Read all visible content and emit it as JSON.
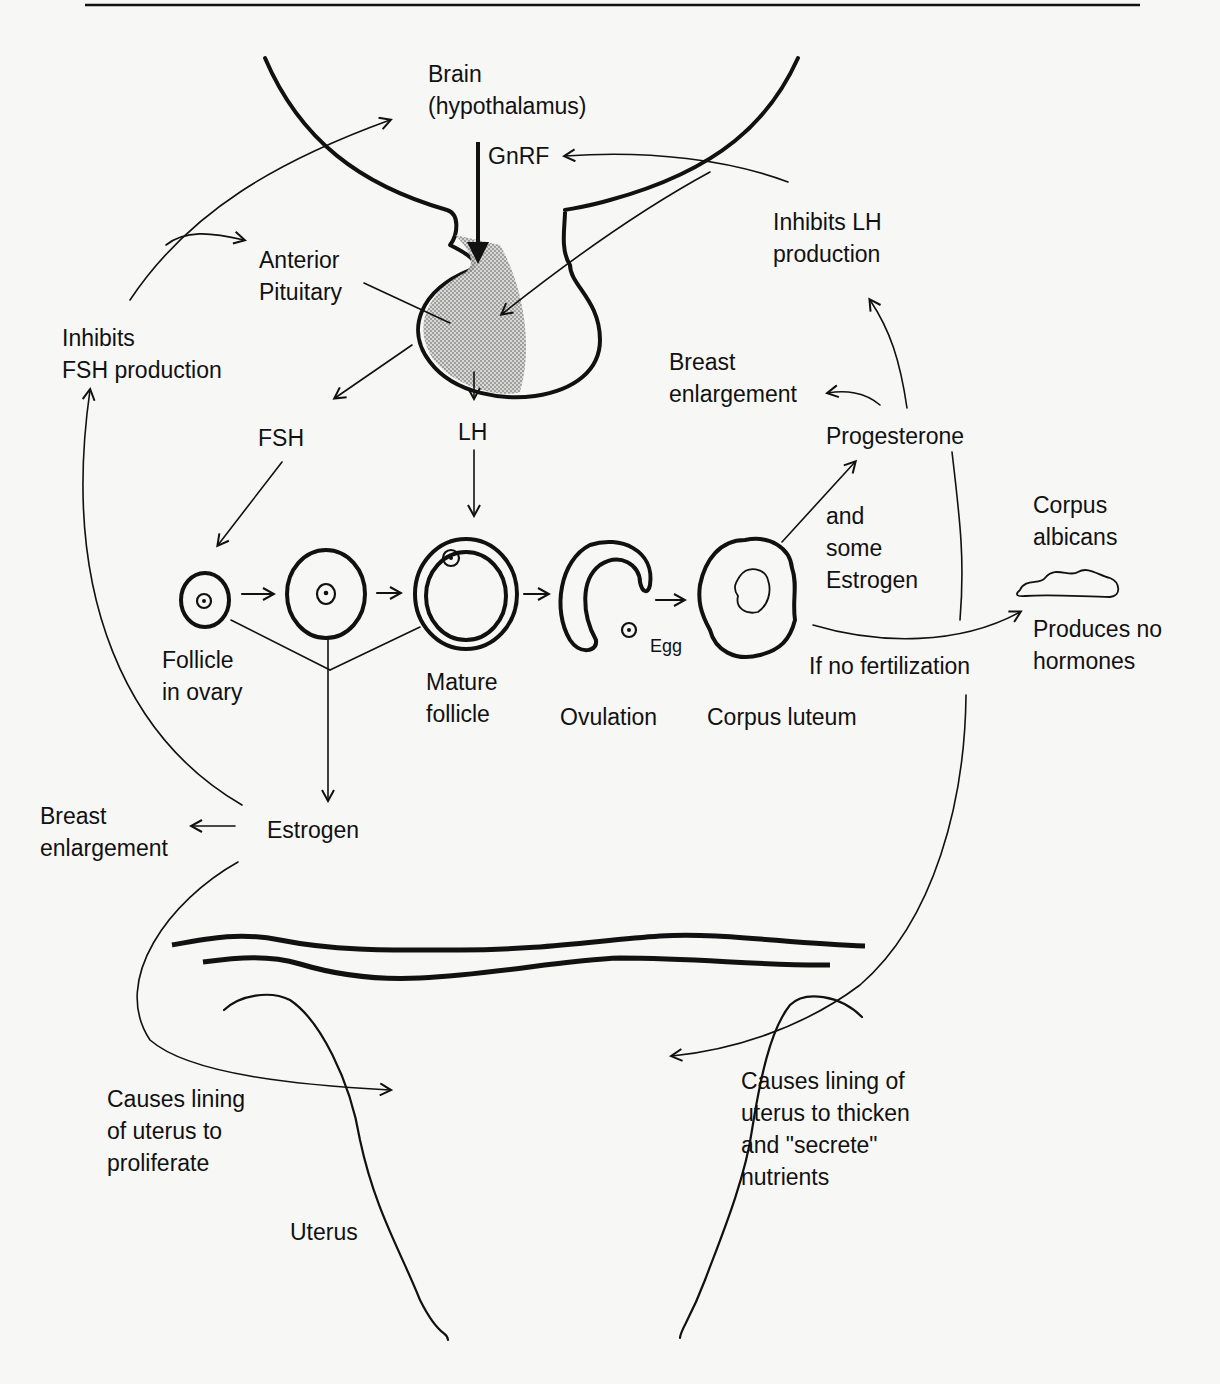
{
  "diagram": {
    "colors": {
      "ink": "#111111",
      "paper": "#f7f7f6",
      "stipple": "#a8a8a8"
    },
    "labels": {
      "brain_line1": "Brain",
      "brain_line2": "(hypothalamus)",
      "gnrf": "GnRF",
      "inhibits_lh_line1": "Inhibits LH",
      "inhibits_lh_line2": "production",
      "anterior_pituitary_line1": "Anterior",
      "anterior_pituitary_line2": "Pituitary",
      "inhibits_fsh_line1": "Inhibits",
      "inhibits_fsh_line2": "FSH production",
      "fsh": "FSH",
      "lh": "LH",
      "breast_top_line1": "Breast",
      "breast_top_line2": "enlargement",
      "progesterone": "Progesterone",
      "and_some_line1": "and",
      "and_some_line2": "some",
      "and_some_line3": "Estrogen",
      "corpus_albicans_line1": "Corpus",
      "corpus_albicans_line2": "albicans",
      "produces_no_line1": "Produces no",
      "produces_no_line2": "hormones",
      "if_no_fertilization": "If no fertilization",
      "follicle_line1": "Follicle",
      "follicle_line2": "in ovary",
      "mature_line1": "Mature",
      "mature_line2": "follicle",
      "ovulation": "Ovulation",
      "egg": "Egg",
      "corpus_luteum": "Corpus luteum",
      "estrogen": "Estrogen",
      "breast_left_line1": "Breast",
      "breast_left_line2": "enlargement",
      "proliferate_line1": "Causes lining",
      "proliferate_line2": "of uterus to",
      "proliferate_line3": "proliferate",
      "thicken_line1": "Causes lining of",
      "thicken_line2": "uterus to thicken",
      "thicken_line3": "and \"secrete\"",
      "thicken_line4": "nutrients",
      "uterus": "Uterus"
    },
    "stages": [
      "Follicle in ovary",
      "Growing follicle",
      "Mature follicle",
      "Ovulation",
      "Corpus luteum",
      "Corpus albicans"
    ]
  }
}
